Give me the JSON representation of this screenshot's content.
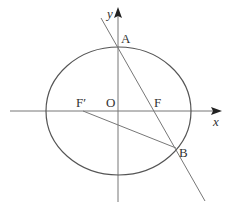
{
  "figure": {
    "type": "ellipse-focal-chord",
    "colors": {
      "stroke": "#555555",
      "axis": "#777777",
      "text": "#333333"
    },
    "axes": {
      "x_label": "x",
      "y_label": "y",
      "origin_label": "O"
    },
    "points": {
      "A": {
        "label": "A"
      },
      "B": {
        "label": "B"
      },
      "F": {
        "label": "F"
      },
      "F_prime": {
        "label": "F′"
      }
    },
    "segments": [
      {
        "name": "line-AB-through-F",
        "from": "A",
        "to": "B",
        "extended": true
      },
      {
        "name": "segment-F-prime-B",
        "from": "F′",
        "to": "B"
      }
    ],
    "ellipse": {
      "center": "O",
      "foci": [
        "F′",
        "F"
      ]
    }
  }
}
